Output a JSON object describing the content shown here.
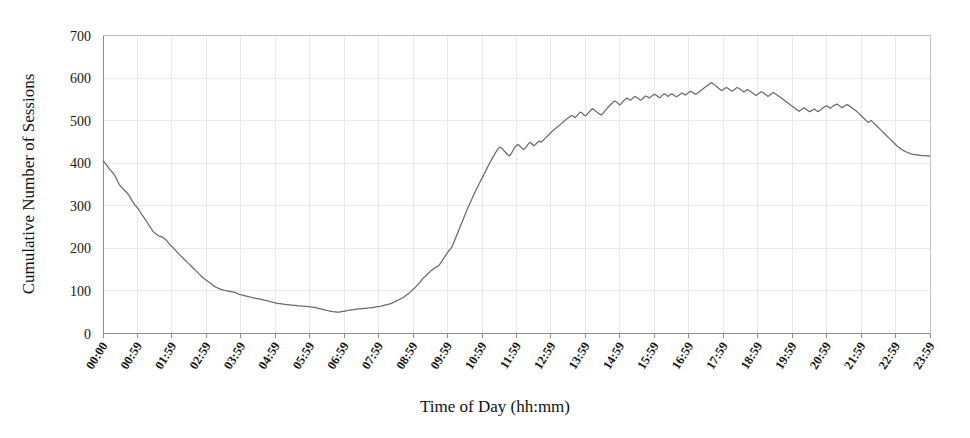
{
  "chart_data": {
    "type": "line",
    "title": "",
    "xlabel": "Time of Day (hh:mm)",
    "ylabel": "Cumulative Number of Sessions",
    "ylim": [
      0,
      700
    ],
    "ytick_labels": [
      "0",
      "100",
      "200",
      "300",
      "400",
      "500",
      "600",
      "700"
    ],
    "ytick_values": [
      0,
      100,
      200,
      300,
      400,
      500,
      600,
      700
    ],
    "grid": true,
    "legend": "none",
    "xtick_labels": [
      "00:00",
      "00:59",
      "01:59",
      "02:59",
      "03:59",
      "04:59",
      "05:59",
      "06:59",
      "07:59",
      "08:59",
      "09:59",
      "10:59",
      "11:59",
      "12:59",
      "13:59",
      "14:59",
      "15:59",
      "16:59",
      "17:59",
      "18:59",
      "19:59",
      "20:59",
      "21:59",
      "22:59",
      "23:59"
    ],
    "series": [
      {
        "name": "Cumulative Number of Sessions",
        "color": "#6b6b6b",
        "x_minutes_step": 5,
        "values": [
          405,
          401,
          396,
          390,
          385,
          381,
          376,
          370,
          362,
          353,
          347,
          343,
          338,
          334,
          330,
          325,
          318,
          311,
          305,
          300,
          295,
          289,
          283,
          277,
          271,
          265,
          259,
          252,
          246,
          240,
          236,
          233,
          230,
          228,
          227,
          225,
          222,
          218,
          213,
          208,
          204,
          200,
          196,
          191,
          187,
          183,
          179,
          175,
          171,
          167,
          163,
          159,
          155,
          151,
          147,
          143,
          139,
          135,
          131,
          128,
          125,
          122,
          119,
          116,
          113,
          110,
          108,
          106,
          104,
          103,
          102,
          101,
          100,
          99,
          99,
          98,
          97,
          96,
          94,
          92,
          91,
          90,
          89,
          88,
          87,
          86,
          85,
          84,
          83,
          82,
          82,
          81,
          80,
          79,
          78,
          77,
          76,
          75,
          74,
          73,
          72,
          71,
          70,
          70,
          69,
          69,
          68,
          68,
          67,
          67,
          66,
          66,
          66,
          65,
          65,
          65,
          64,
          64,
          64,
          63,
          63,
          62,
          62,
          61,
          60,
          59,
          58,
          57,
          56,
          55,
          54,
          53,
          52,
          52,
          51,
          51,
          50,
          50,
          51,
          52,
          52,
          53,
          54,
          55,
          55,
          56,
          56,
          57,
          58,
          58,
          58,
          59,
          59,
          59,
          60,
          60,
          61,
          61,
          62,
          63,
          63,
          64,
          65,
          66,
          67,
          68,
          69,
          70,
          72,
          74,
          76,
          78,
          80,
          82,
          84,
          87,
          90,
          93,
          96,
          100,
          104,
          107,
          112,
          116,
          120,
          126,
          131,
          134,
          138,
          142,
          146,
          149,
          152,
          155,
          157,
          160,
          166,
          172,
          178,
          184,
          190,
          196,
          200,
          208,
          218,
          228,
          238,
          248,
          258,
          268,
          278,
          288,
          297,
          306,
          315,
          324,
          333,
          341,
          349,
          357,
          365,
          373,
          381,
          389,
          397,
          405,
          412,
          419,
          426,
          432,
          437,
          437,
          433,
          428,
          424,
          420,
          417,
          423,
          430,
          437,
          442,
          444,
          440,
          436,
          432,
          435,
          440,
          446,
          449,
          445,
          441,
          444,
          448,
          452,
          449,
          452,
          456,
          460,
          464,
          468,
          472,
          476,
          479,
          483,
          486,
          489,
          493,
          497,
          500,
          503,
          506,
          509,
          512,
          510,
          507,
          511,
          516,
          520,
          518,
          514,
          511,
          515,
          520,
          524,
          528,
          526,
          522,
          519,
          516,
          513,
          516,
          521,
          526,
          531,
          535,
          539,
          543,
          546,
          544,
          540,
          537,
          541,
          546,
          550,
          553,
          551,
          548,
          551,
          555,
          557,
          554,
          551,
          548,
          551,
          555,
          558,
          556,
          553,
          556,
          559,
          562,
          560,
          557,
          554,
          557,
          561,
          563,
          560,
          557,
          560,
          563,
          561,
          558,
          556,
          559,
          562,
          565,
          563,
          560,
          563,
          566,
          569,
          567,
          564,
          562,
          565,
          568,
          571,
          574,
          577,
          580,
          583,
          586,
          589,
          587,
          584,
          580,
          577,
          574,
          571,
          573,
          576,
          578,
          575,
          572,
          569,
          572,
          575,
          578,
          576,
          573,
          570,
          567,
          570,
          573,
          571,
          568,
          565,
          562,
          559,
          562,
          565,
          568,
          566,
          563,
          560,
          557,
          560,
          563,
          566,
          564,
          561,
          558,
          555,
          552,
          549,
          546,
          543,
          540,
          537,
          534,
          531,
          528,
          525,
          522,
          525,
          528,
          530,
          527,
          524,
          521,
          523,
          525,
          527,
          524,
          521,
          524,
          527,
          530,
          533,
          535,
          532,
          529,
          532,
          535,
          537,
          539,
          536,
          533,
          530,
          533,
          536,
          538,
          535,
          532,
          529,
          526,
          523,
          520,
          516,
          512,
          508,
          504,
          500,
          496,
          498,
          500,
          496,
          492,
          488,
          484,
          480,
          476,
          472,
          468,
          464,
          460,
          456,
          452,
          448,
          444,
          440,
          437,
          434,
          431,
          429,
          427,
          425,
          424,
          422,
          421,
          420,
          420,
          419,
          419,
          418,
          418,
          418,
          417,
          417,
          417
        ]
      }
    ]
  },
  "axes": {
    "y_title": "Cumulative Number of Sessions",
    "x_title": "Time of Day (hh:mm)"
  }
}
